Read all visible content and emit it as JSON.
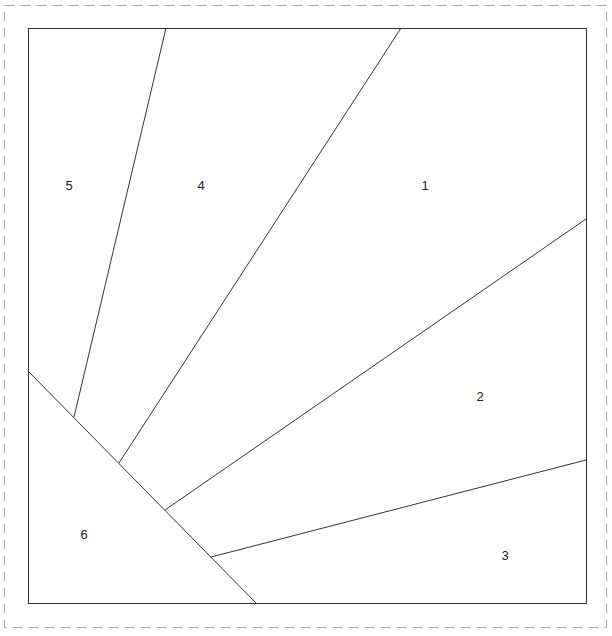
{
  "diagram": {
    "type": "paper-piecing-pattern",
    "colors": {
      "line": "#333333",
      "dashed_border": "#aaaaaa",
      "label": "#222222",
      "background": "#ffffff"
    },
    "outer_dashed_border": {
      "x": 4,
      "y": 5,
      "width": 602,
      "height": 622
    },
    "block": {
      "x": 28,
      "y": 28,
      "width": 558,
      "height": 575
    },
    "seams": [
      {
        "id": "diag",
        "x1": 28,
        "y1": 371,
        "x2": 256,
        "y2": 603
      },
      {
        "id": "s5-4",
        "x1": 166,
        "y1": 28,
        "x2": 74,
        "y2": 417
      },
      {
        "id": "s4-1",
        "x1": 401,
        "y1": 28,
        "x2": 119,
        "y2": 463
      },
      {
        "id": "s1-2",
        "x1": 586,
        "y1": 219,
        "x2": 165,
        "y2": 510
      },
      {
        "id": "s2-3",
        "x1": 586,
        "y1": 460,
        "x2": 211,
        "y2": 557
      }
    ],
    "pieces": [
      {
        "number": "1",
        "x": 425,
        "y": 190
      },
      {
        "number": "2",
        "x": 480,
        "y": 401
      },
      {
        "number": "3",
        "x": 505,
        "y": 560
      },
      {
        "number": "4",
        "x": 201,
        "y": 190
      },
      {
        "number": "5",
        "x": 69,
        "y": 190
      },
      {
        "number": "6",
        "x": 84,
        "y": 539
      }
    ]
  }
}
